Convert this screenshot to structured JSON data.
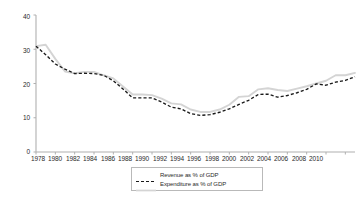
{
  "chart_data": {
    "type": "line",
    "title": "",
    "subtitle": "",
    "xlabel": "",
    "ylabel": "",
    "xlim": [
      1978,
      2011
    ],
    "ylim": [
      0,
      40
    ],
    "grid": false,
    "legend_position": "bottom-center",
    "x": [
      1978,
      1979,
      1980,
      1981,
      1982,
      1983,
      1984,
      1985,
      1986,
      1987,
      1988,
      1989,
      1990,
      1991,
      1992,
      1993,
      1994,
      1995,
      1996,
      1997,
      1998,
      1999,
      2000,
      2001,
      2002,
      2003,
      2004,
      2005,
      2006,
      2007,
      2008,
      2009,
      2010,
      2011
    ],
    "xticks": [
      "1978",
      "1980",
      "1982",
      "1984",
      "1986",
      "1988",
      "1990",
      "1992",
      "1994",
      "1996",
      "1998",
      "2000",
      "2002",
      "2004",
      "2006",
      "2008",
      "2010"
    ],
    "yticks": [
      "0",
      "10",
      "20",
      "30",
      "40"
    ],
    "series": [
      {
        "name": "Revenue as % of GDP",
        "style": "dashed",
        "color": "#1a1a1a",
        "values": [
          30.9,
          28.4,
          25.7,
          24.2,
          22.9,
          23.0,
          22.9,
          22.4,
          20.8,
          18.4,
          15.8,
          15.8,
          15.8,
          14.6,
          13.1,
          12.6,
          11.2,
          10.7,
          10.9,
          11.6,
          12.6,
          13.9,
          15.1,
          16.8,
          16.9,
          16.0,
          16.5,
          17.3,
          18.3,
          19.9,
          19.5,
          20.4,
          20.9,
          22.0
        ]
      },
      {
        "name": "Expenditure as % of GDP",
        "style": "solid",
        "color": "#d4d4d4",
        "values": [
          30.9,
          31.3,
          27.2,
          23.5,
          23.0,
          23.4,
          23.4,
          22.4,
          21.5,
          19.1,
          16.8,
          16.8,
          16.6,
          15.6,
          14.2,
          13.9,
          12.4,
          11.7,
          11.7,
          12.4,
          13.8,
          16.1,
          16.3,
          18.3,
          18.6,
          18.1,
          17.8,
          18.5,
          19.2,
          20.0,
          20.8,
          22.4,
          22.4,
          23.1
        ]
      }
    ]
  },
  "axis": {
    "y_labels": [
      {
        "text": "40",
        "top": 13
      },
      {
        "text": "30",
        "top": 47
      },
      {
        "text": "20",
        "top": 81
      },
      {
        "text": "10",
        "top": 114
      },
      {
        "text": "0",
        "top": 148
      }
    ],
    "x_labels": [
      {
        "text": "1978",
        "left": 26
      },
      {
        "text": "1980",
        "left": 43
      },
      {
        "text": "1982",
        "left": 61
      },
      {
        "text": "1984",
        "left": 78
      },
      {
        "text": "1986",
        "left": 96
      },
      {
        "text": "1988",
        "left": 113
      },
      {
        "text": "1990",
        "left": 130
      },
      {
        "text": "1992",
        "left": 148
      },
      {
        "text": "1994",
        "left": 165
      },
      {
        "text": "1996",
        "left": 182
      },
      {
        "text": "1998",
        "left": 200
      },
      {
        "text": "2000",
        "left": 217
      },
      {
        "text": "2002",
        "left": 235
      },
      {
        "text": "2004",
        "left": 252
      },
      {
        "text": "2006",
        "left": 269
      },
      {
        "text": "2008",
        "left": 287
      },
      {
        "text": "2010",
        "left": 304
      }
    ]
  },
  "legend": {
    "items": [
      {
        "label": "Revenue as % of GDP",
        "style": "dashed",
        "color": "#1a1a1a"
      },
      {
        "label": "Expenditure as % of GDP",
        "style": "solid",
        "color": "#d4d4d4"
      }
    ]
  },
  "colors": {
    "axis": "#b0b0b0",
    "revenue": "#1a1a1a",
    "expenditure": "#d4d4d4",
    "text": "#2b2b2b",
    "background": "#ffffff"
  }
}
